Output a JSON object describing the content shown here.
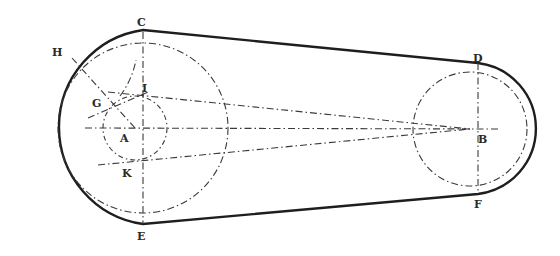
{
  "figure": {
    "colors": {
      "ink": "#1e1e1e",
      "construction": "#3a3a3a",
      "background": "#ffffff"
    },
    "points": {
      "A": {
        "label": "A",
        "x": 135,
        "y": 128
      },
      "B": {
        "label": "B",
        "x": 470,
        "y": 129
      },
      "C": {
        "label": "C",
        "x": 143,
        "y": 30
      },
      "D": {
        "label": "D",
        "x": 478,
        "y": 63
      },
      "E": {
        "label": "E",
        "x": 143,
        "y": 224
      },
      "F": {
        "label": "F",
        "x": 478,
        "y": 194
      },
      "G": {
        "label": "G",
        "x": 108,
        "y": 100
      },
      "H": {
        "label": "H",
        "x": 72,
        "y": 54
      },
      "I": {
        "label": "I",
        "x": 138,
        "y": 93
      },
      "K": {
        "label": "K",
        "x": 140,
        "y": 161
      }
    },
    "labels": {
      "A": "A",
      "B": "B",
      "C": "C",
      "D": "D",
      "E": "E",
      "F": "F",
      "G": "G",
      "H": "H",
      "I": "I",
      "K": "K"
    }
  }
}
